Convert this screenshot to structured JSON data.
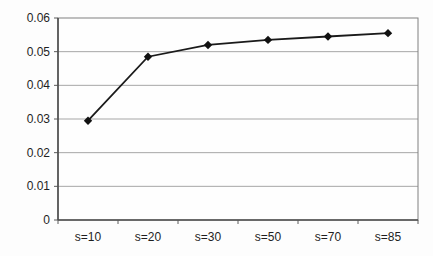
{
  "figure": {
    "background": "#fdfdfd",
    "plot_background": "#fefefe"
  },
  "chart_data": {
    "type": "line",
    "title": "",
    "xlabel": "",
    "ylabel": "",
    "categories": [
      "s=10",
      "s=20",
      "s=30",
      "s=50",
      "s=70",
      "s=85"
    ],
    "series": [
      {
        "name": "series-1",
        "values": [
          0.0295,
          0.0485,
          0.052,
          0.0535,
          0.0545,
          0.0555
        ]
      }
    ],
    "ylim": [
      0,
      0.06
    ],
    "ytick_interval": 0.01,
    "ytick_labels": [
      "0",
      "0.01",
      "0.02",
      "0.03",
      "0.04",
      "0.05",
      "0.06"
    ],
    "grid": "horizontal",
    "legend_position": "none",
    "marker": "diamond",
    "colors": {
      "line": "#1a1a1a",
      "marker": "#111111",
      "grid": "#a6a6a6",
      "border": "#808080",
      "axis": "#4d4d4d",
      "tick": "#5a5a5a",
      "tick_label": "#1f1f1f"
    }
  }
}
